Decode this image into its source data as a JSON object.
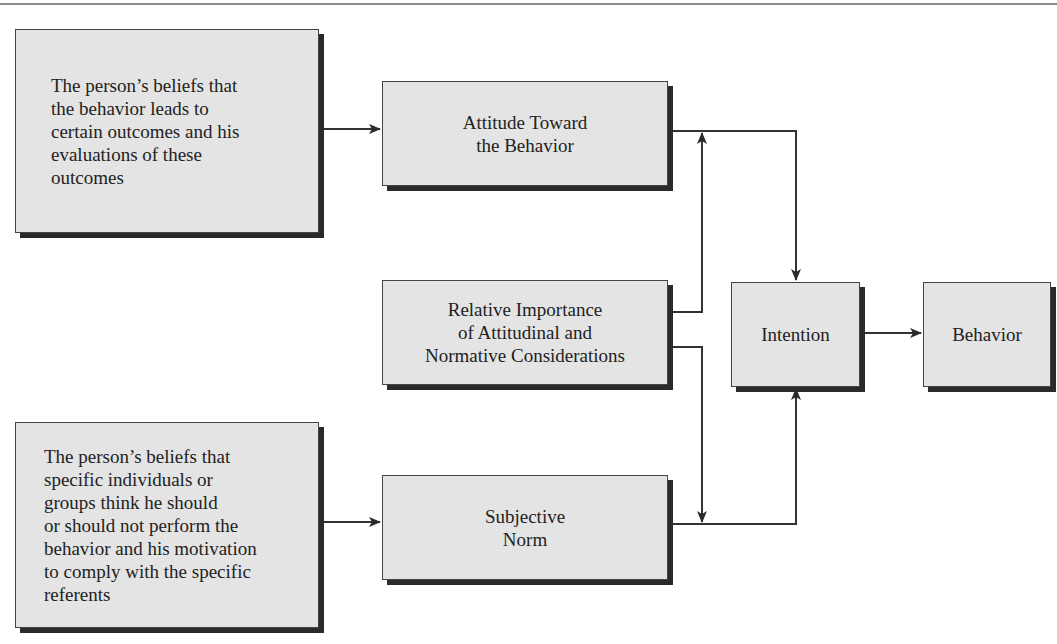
{
  "diagram": {
    "type": "flow-diagram",
    "nodes": {
      "outcome_beliefs": {
        "label": "The person’s beliefs that\nthe behavior leads to\ncertain outcomes and his\nevaluations of these\noutcomes"
      },
      "attitude": {
        "label": "Attitude Toward\nthe Behavior"
      },
      "relative_importance": {
        "label": "Relative Importance\nof Attitudinal and\nNormative Considerations"
      },
      "normative_beliefs": {
        "label": "The person’s beliefs that\nspecific individuals or\ngroups think he should\nor should not perform the\nbehavior and his motivation\nto comply with the specific\nreferents"
      },
      "subjective_norm": {
        "label": "Subjective\nNorm"
      },
      "intention": {
        "label": "Intention"
      },
      "behavior": {
        "label": "Behavior"
      }
    },
    "edges": [
      {
        "from": "outcome_beliefs",
        "to": "attitude"
      },
      {
        "from": "normative_beliefs",
        "to": "subjective_norm"
      },
      {
        "from": "attitude",
        "to": "intention"
      },
      {
        "from": "subjective_norm",
        "to": "intention"
      },
      {
        "from": "relative_importance",
        "to": "attitude-intention-link"
      },
      {
        "from": "relative_importance",
        "to": "subjective_norm-intention-link"
      },
      {
        "from": "intention",
        "to": "behavior"
      }
    ],
    "colors": {
      "box_fill": "#e4e4e4",
      "border": "#444444",
      "shadow": "#2a2a2a",
      "line": "#333333"
    }
  }
}
